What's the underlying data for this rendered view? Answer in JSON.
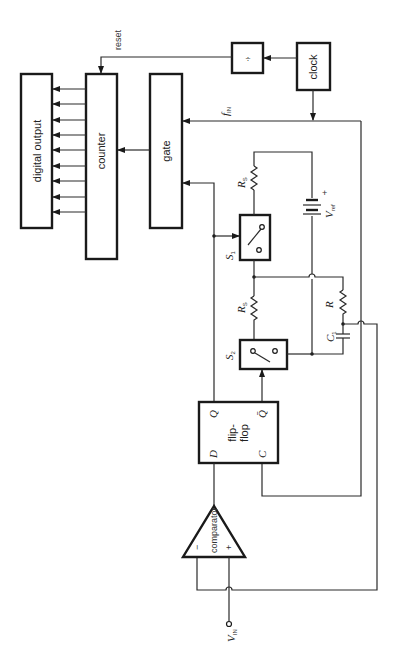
{
  "diagram": {
    "blocks": {
      "digital_output": "digital output",
      "counter": "counter",
      "gate": "gate",
      "divider": "÷",
      "clock": "clock",
      "flip_flop": {
        "label_line1": "flip-",
        "label_line2": "flop",
        "pin_D": "D",
        "pin_C": "C",
        "pin_Q": "Q",
        "pin_Qbar": "Q̄"
      },
      "comparator": {
        "label": "comparator",
        "minus": "−",
        "plus": "+"
      }
    },
    "signals": {
      "reset": "reset",
      "fin_main": "f",
      "fin_sub": "IN",
      "vin_main": "V",
      "vin_sub": "IN",
      "vref_main": "V",
      "vref_sub": "ref",
      "vref_plus": "+"
    },
    "components": {
      "s1_main": "S",
      "s1_sub": "1",
      "s2_main": "S",
      "s2_sub": "2",
      "rs1_main": "R",
      "rs1_sub": "S",
      "rs2_main": "R",
      "rs2_sub": "S",
      "r": "R",
      "c1_main": "C",
      "c1_sub": "1"
    },
    "output_bit_count": 9
  }
}
